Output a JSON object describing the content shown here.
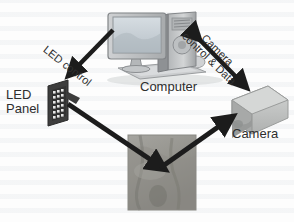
{
  "figure": {
    "type": "system-block-diagram",
    "background_color": "#fdfdfd",
    "arrow_color": "#1c1c1c",
    "label_color": "#2e2e2e"
  },
  "nodes": {
    "computer": {
      "label": "Computer",
      "icon": "desktop-computer-icon",
      "parts": [
        "monitor",
        "tower",
        "keyboard",
        "mouse"
      ],
      "colors": {
        "case": "#b9bcbe",
        "screen": "#c9d2d8",
        "shadow": "#8d9093"
      }
    },
    "camera": {
      "label": "Camera",
      "icon": "camera-box-icon",
      "colors": {
        "body": "#c2c4c3",
        "side": "#a9abaa",
        "top": "#d2d4d3"
      }
    },
    "led_panel": {
      "label_line1": "LED",
      "label_line2": "Panel",
      "icon": "led-panel-icon",
      "grid_columns": 4,
      "grid_rows": 6,
      "colors": {
        "frame": "#3a3a3a",
        "led_on": "#e8e8e8"
      }
    },
    "sample": {
      "label": "",
      "icon": "tissue-photo-icon",
      "colors": {
        "base": "#9b9a96",
        "highlight": "#c3c2bd",
        "shadow": "#6e6d6a"
      }
    }
  },
  "arrows": [
    {
      "name": "led-control-arrow",
      "label": "LED control",
      "from": "computer",
      "to": "led_panel",
      "heads": "single",
      "direction": "down-left"
    },
    {
      "name": "camera-control-arrow",
      "label_line1": "Camera",
      "label_line2": "control & Data",
      "from": "computer",
      "to": "camera",
      "heads": "double",
      "direction": "down-right"
    },
    {
      "name": "illumination-arrow",
      "label": "",
      "from": "led_panel",
      "to": "sample",
      "heads": "single",
      "direction": "down-right"
    },
    {
      "name": "imaging-arrow",
      "label": "",
      "from": "sample",
      "to": "camera",
      "heads": "single",
      "direction": "up-right"
    }
  ]
}
